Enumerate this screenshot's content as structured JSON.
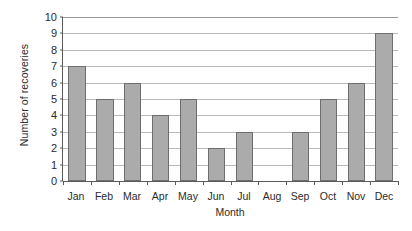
{
  "chart_data": {
    "type": "bar",
    "title": "",
    "subtitle": "",
    "xlabel": "Month",
    "ylabel": "Number of recoveries",
    "categories": [
      "Jan",
      "Feb",
      "Mar",
      "Apr",
      "May",
      "Jun",
      "Jul",
      "Aug",
      "Sep",
      "Oct",
      "Nov",
      "Dec"
    ],
    "values": [
      7,
      5,
      6,
      4,
      5,
      2,
      3,
      0,
      3,
      5,
      6,
      9
    ],
    "ylim": [
      0,
      10
    ],
    "ytick_labels": [
      "0",
      "1",
      "2",
      "3",
      "4",
      "5",
      "6",
      "7",
      "8",
      "9",
      "10"
    ],
    "ytick_values": [
      0,
      1,
      2,
      3,
      4,
      5,
      6,
      7,
      8,
      9,
      10
    ],
    "grid": "horizontal",
    "legend": "none",
    "bar_fill_color": "#ababab",
    "bar_edge_color": "#6e6e6e",
    "axis_color": "#5a5a5a",
    "gridline_color": "#b9b9b9",
    "background_color": "#ffffff",
    "text_color": "#2b2b2b"
  },
  "figure": {
    "caption_edge_text": ""
  }
}
